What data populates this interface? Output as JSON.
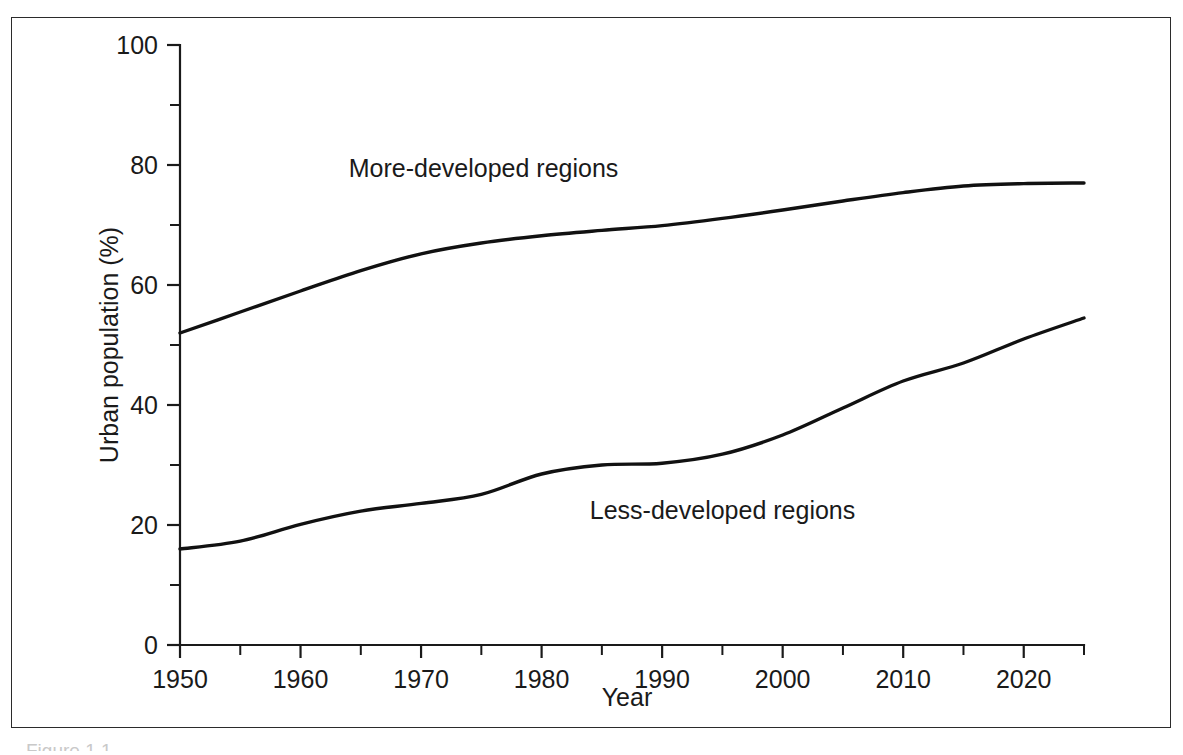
{
  "figure": {
    "frame_color": "#2b2b2b",
    "background": "#ffffff",
    "partial_caption": "Figure 1.1"
  },
  "chart_data": {
    "type": "line",
    "title": "",
    "xlabel": "Year",
    "ylabel": "Urban population (%)",
    "xlim": [
      1950,
      2025
    ],
    "ylim": [
      0,
      100
    ],
    "grid": false,
    "legend_position": "inline-annotation",
    "x_ticks_major": [
      1950,
      1960,
      1970,
      1980,
      1990,
      2000,
      2010,
      2020
    ],
    "x_ticks_minor": [
      1955,
      1965,
      1975,
      1985,
      1995,
      2005,
      2015,
      2025
    ],
    "y_ticks_major": [
      0,
      20,
      40,
      60,
      80,
      100
    ],
    "y_ticks_minor": [
      10,
      30,
      50,
      70,
      90
    ],
    "x_tick_labels": [
      "1950",
      "1960",
      "1970",
      "1980",
      "1990",
      "2000",
      "2010",
      "2020"
    ],
    "y_tick_labels": [
      "0",
      "20",
      "40",
      "60",
      "80",
      "100"
    ],
    "line_color": "#111111",
    "x": [
      1950,
      1955,
      1960,
      1965,
      1970,
      1975,
      1980,
      1985,
      1990,
      1995,
      2000,
      2005,
      2010,
      2015,
      2020,
      2025
    ],
    "series": [
      {
        "name": "More-developed regions",
        "label": "More-developed regions",
        "label_x": 1964,
        "label_y": 78,
        "values": [
          52.0,
          55.5,
          59.0,
          62.4,
          65.2,
          67.0,
          68.2,
          69.1,
          69.9,
          71.1,
          72.5,
          74.0,
          75.4,
          76.5,
          76.9,
          77.0
        ]
      },
      {
        "name": "Less-developed regions",
        "label": "Less-developed regions",
        "label_x": 1984,
        "label_y": 21,
        "values": [
          16.0,
          17.3,
          20.1,
          22.3,
          23.6,
          25.1,
          28.5,
          30.0,
          30.3,
          31.8,
          35.0,
          39.5,
          44.0,
          47.0,
          51.0,
          54.5
        ]
      }
    ]
  }
}
